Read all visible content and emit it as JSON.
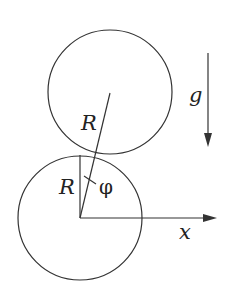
{
  "diagram": {
    "labels": {
      "upper_radius": "R",
      "lower_radius": "R",
      "angle": "φ",
      "gravity": "g",
      "x_axis": "x"
    },
    "colors": {
      "stroke": "#333333",
      "background": "#ffffff"
    }
  }
}
